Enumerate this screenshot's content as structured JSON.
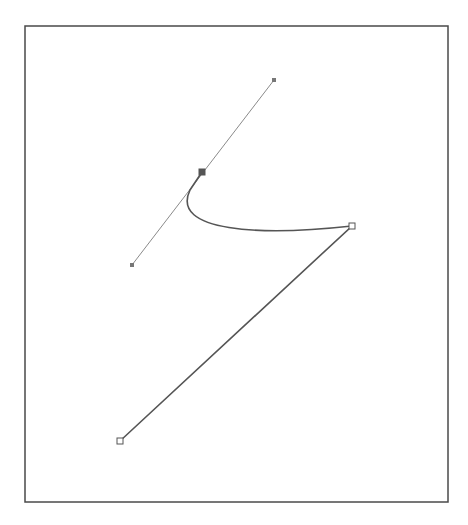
{
  "canvas": {
    "width": 468,
    "height": 525,
    "background": "#ffffff"
  },
  "frame": {
    "x": 25,
    "y": 26,
    "width": 423,
    "height": 476,
    "stroke": "#4a4a4a"
  },
  "path": {
    "stroke": "#555555",
    "segments": [
      {
        "type": "line",
        "from": [
          120,
          441
        ],
        "to": [
          352,
          226
        ]
      },
      {
        "type": "curve",
        "from": [
          352,
          226
        ],
        "c1": [
          260,
          236
        ],
        "c2": [
          170,
          232
        ],
        "to": [
          190,
          190
        ]
      },
      {
        "type": "line",
        "from": [
          190,
          190
        ],
        "to": [
          202,
          172
        ]
      }
    ]
  },
  "anchors": [
    {
      "name": "anchor-start",
      "x": 120,
      "y": 441,
      "style": "hollow-square"
    },
    {
      "name": "anchor-corner",
      "x": 352,
      "y": 226,
      "style": "hollow-square"
    },
    {
      "name": "anchor-smooth",
      "x": 202,
      "y": 172,
      "style": "filled-square"
    }
  ],
  "handle": {
    "stroke": "#8a8a8a",
    "from": [
      132,
      265
    ],
    "to": [
      274,
      80
    ],
    "endpoints": [
      {
        "name": "handle-point-upper",
        "x": 274,
        "y": 80
      },
      {
        "name": "handle-point-lower",
        "x": 132,
        "y": 265
      }
    ]
  }
}
